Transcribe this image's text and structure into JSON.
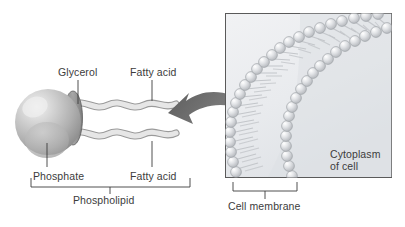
{
  "figure": {
    "background_color": "#ffffff",
    "text_color": "#3c3c3c"
  },
  "left_panel": {
    "name": "phospholipid-molecule",
    "labels": {
      "glycerol": "Glycerol",
      "fatty_acid_top": "Fatty acid",
      "fatty_acid_bottom": "Fatty acid",
      "phosphate": "Phosphate",
      "phospholipid": "Phospholipid"
    },
    "parts": {
      "head_name": "phosphate-head-sphere",
      "head_color": "#b5b5b5",
      "glycerol_color": "#8a8a8a",
      "tail_fill": "#e3e3e3",
      "tail_stroke": "#9a9a9a",
      "tail_count": 2
    }
  },
  "arrow": {
    "name": "zoom-arrow",
    "direction": "left",
    "color": "#6b6b6b"
  },
  "right_panel": {
    "name": "cell-membrane-panel",
    "border_color": "#5a5a5a",
    "background_color": "#eceef0",
    "labels": {
      "cytoplasm_line1": "Cytoplasm",
      "cytoplasm_line2": "of cell",
      "cell_membrane": "Cell membrane"
    },
    "membrane": {
      "name": "phospholipid-bilayer",
      "layers": 2,
      "head_color": "#d8dade",
      "head_stroke": "#9fa3a8",
      "tail_color": "#b9bcc0"
    }
  }
}
